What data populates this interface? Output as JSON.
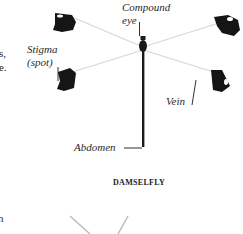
{
  "diagram": {
    "title": "DAMSELFLY",
    "labels": {
      "compound_eye_line1": "Compound",
      "compound_eye_line2": "eye",
      "stigma_line1": "Stigma",
      "stigma_line2": "(spot)",
      "vein": "Vein",
      "abdomen": "Abdomen"
    },
    "left_edge_fragments": {
      "line1": "s,",
      "line2": "e.",
      "bottom": "n"
    },
    "colors": {
      "ink": "#1a1a1a",
      "wing_membrane": "#d8d8d8",
      "background": "#ffffff"
    }
  }
}
